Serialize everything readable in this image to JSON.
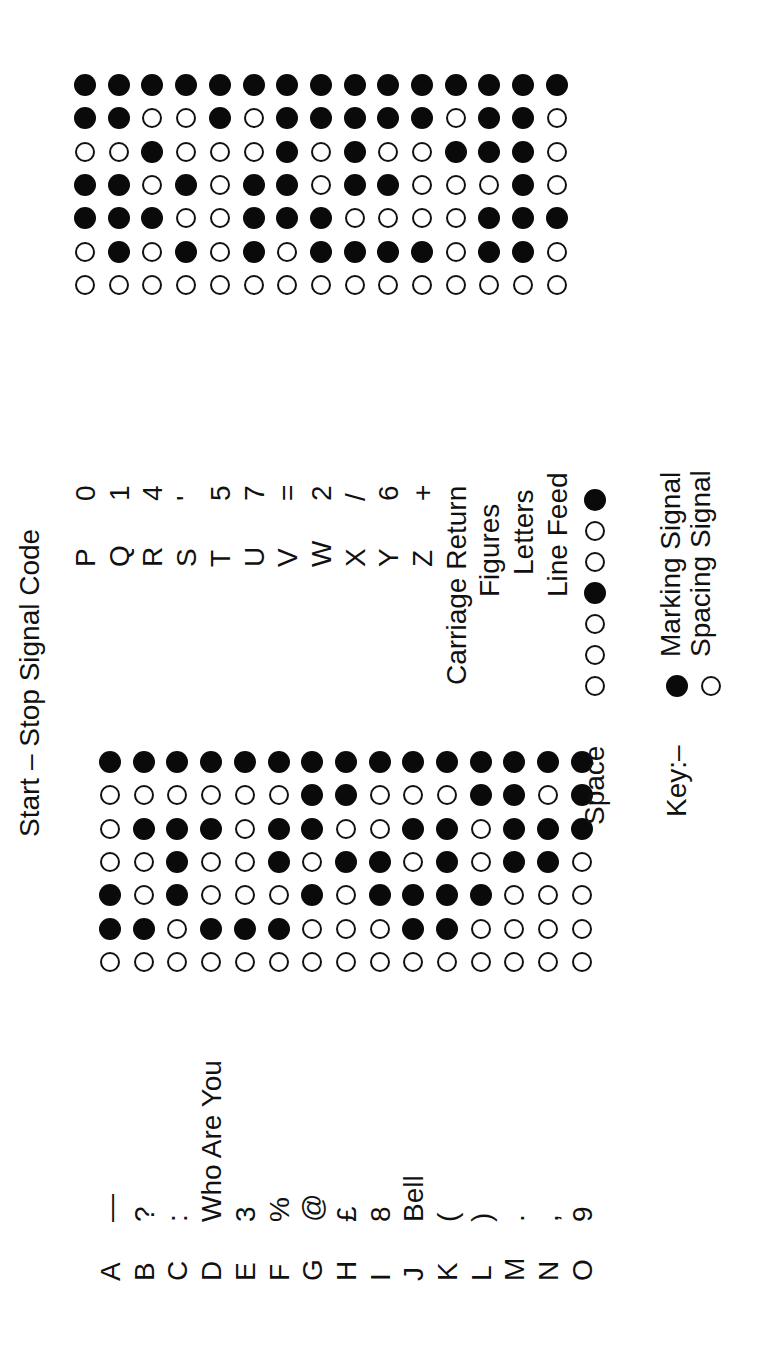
{
  "title": "Start – Stop Signal Code",
  "bit_order": [
    "start",
    "b1",
    "b2",
    "b3",
    "b4",
    "b5",
    "stop"
  ],
  "left_table": {
    "rows": [
      {
        "letter": "A",
        "figure": "—",
        "bits": [
          0,
          1,
          1,
          0,
          0,
          0,
          1
        ]
      },
      {
        "letter": "B",
        "figure": "?",
        "bits": [
          0,
          1,
          0,
          0,
          1,
          0,
          1
        ]
      },
      {
        "letter": "C",
        "figure": ":",
        "bits": [
          0,
          0,
          1,
          1,
          1,
          0,
          1
        ]
      },
      {
        "letter": "D",
        "figure": "Who Are You",
        "bits": [
          0,
          1,
          0,
          0,
          1,
          0,
          1
        ]
      },
      {
        "letter": "E",
        "figure": "3",
        "bits": [
          0,
          1,
          0,
          0,
          0,
          0,
          1
        ]
      },
      {
        "letter": "F",
        "figure": "%",
        "bits": [
          0,
          1,
          0,
          1,
          1,
          0,
          1
        ]
      },
      {
        "letter": "G",
        "figure": "@",
        "bits": [
          0,
          0,
          1,
          0,
          1,
          1,
          1
        ]
      },
      {
        "letter": "H",
        "figure": "£",
        "bits": [
          0,
          0,
          0,
          1,
          0,
          1,
          1
        ]
      },
      {
        "letter": "I",
        "figure": "8",
        "bits": [
          0,
          0,
          1,
          1,
          0,
          0,
          1
        ]
      },
      {
        "letter": "J",
        "figure": "Bell",
        "bits": [
          0,
          1,
          1,
          0,
          1,
          0,
          1
        ]
      },
      {
        "letter": "K",
        "figure": "(",
        "bits": [
          0,
          1,
          1,
          1,
          1,
          0,
          1
        ]
      },
      {
        "letter": "L",
        "figure": ")",
        "bits": [
          0,
          0,
          1,
          0,
          0,
          1,
          1
        ]
      },
      {
        "letter": "M",
        "figure": ".",
        "bits": [
          0,
          0,
          0,
          1,
          1,
          1,
          1
        ]
      },
      {
        "letter": "N",
        "figure": ",",
        "bits": [
          0,
          0,
          0,
          1,
          1,
          0,
          1
        ]
      },
      {
        "letter": "O",
        "figure": "9",
        "bits": [
          0,
          0,
          0,
          0,
          1,
          1,
          1
        ]
      }
    ]
  },
  "right_table": {
    "rows": [
      {
        "letter": "P",
        "figure": "0",
        "bits": [
          0,
          0,
          1,
          1,
          0,
          1,
          1
        ]
      },
      {
        "letter": "Q",
        "figure": "1",
        "bits": [
          0,
          1,
          1,
          1,
          0,
          1,
          1
        ]
      },
      {
        "letter": "R",
        "figure": "4",
        "bits": [
          0,
          0,
          1,
          0,
          1,
          0,
          1
        ]
      },
      {
        "letter": "S",
        "figure": "'",
        "bits": [
          0,
          1,
          0,
          1,
          0,
          0,
          1
        ]
      },
      {
        "letter": "T",
        "figure": "5",
        "bits": [
          0,
          0,
          0,
          0,
          0,
          1,
          1
        ]
      },
      {
        "letter": "U",
        "figure": "7",
        "bits": [
          0,
          1,
          1,
          1,
          0,
          0,
          1
        ]
      },
      {
        "letter": "V",
        "figure": "=",
        "bits": [
          0,
          0,
          1,
          1,
          1,
          1,
          1
        ]
      },
      {
        "letter": "W",
        "figure": "2",
        "bits": [
          0,
          1,
          1,
          0,
          0,
          1,
          1
        ]
      },
      {
        "letter": "X",
        "figure": "/",
        "bits": [
          0,
          1,
          0,
          1,
          1,
          1,
          1
        ]
      },
      {
        "letter": "Y",
        "figure": "6",
        "bits": [
          0,
          1,
          0,
          1,
          0,
          1,
          1
        ]
      },
      {
        "letter": "Z",
        "figure": "+",
        "bits": [
          0,
          1,
          0,
          0,
          0,
          1,
          1
        ]
      },
      {
        "letter": "",
        "figure": "Carriage Return",
        "bits": [
          0,
          0,
          0,
          0,
          1,
          0,
          1
        ]
      },
      {
        "letter": "",
        "figure": "Figures",
        "bits": [
          0,
          1,
          1,
          0,
          1,
          1,
          1
        ]
      },
      {
        "letter": "",
        "figure": "Letters",
        "bits": [
          0,
          1,
          1,
          1,
          1,
          1,
          1
        ]
      },
      {
        "letter": "",
        "figure": "Line Feed",
        "bits": [
          0,
          0,
          1,
          0,
          0,
          0,
          1
        ]
      }
    ]
  },
  "space": {
    "label": "Space",
    "bits": [
      0,
      0,
      0,
      1,
      0,
      0,
      1
    ]
  },
  "key": {
    "label": "Key:–",
    "items": [
      {
        "symbol": "filled-circle",
        "label": "Marking Signal"
      },
      {
        "symbol": "open-circle",
        "label": "Spacing Signal"
      }
    ]
  }
}
